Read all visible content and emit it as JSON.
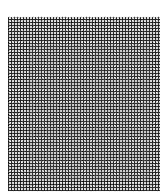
{
  "image": {
    "description": "Dense dot/grid halftone texture",
    "pattern": {
      "period_px": 3,
      "dot_color": "#141414",
      "background_color": "#d8d8d8",
      "page_background": "#ffffff"
    },
    "caption": ""
  }
}
